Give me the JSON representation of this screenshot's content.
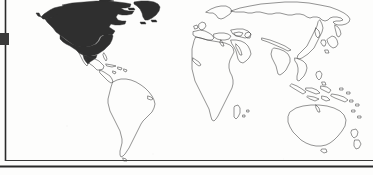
{
  "figure": {
    "kind": "world-map",
    "projection": "mercator-style world outline",
    "background_color": "#fdfdfc",
    "outline_color": "#3a3a3a",
    "highlight_fill_color": "#2f2f2f",
    "frame_color": "#2a2a2a",
    "caption": "",
    "title": "",
    "scan_artifact": true
  },
  "frame": {
    "left_border": {
      "visible": true,
      "x": 5,
      "y_start": 0,
      "y_end": 161,
      "thickness": 2
    },
    "top_border": {
      "visible": false
    },
    "right_border": {
      "visible": false
    },
    "inner_bottom_rule": {
      "visible": true,
      "y": 160,
      "thickness": 1
    },
    "outer_bottom_rule": {
      "visible": true,
      "y": 166,
      "thickness": 2
    },
    "left_tab_marker": {
      "visible": true,
      "x": 0,
      "y": 33,
      "width": 9,
      "height": 12,
      "color": "#3a3a3a"
    }
  },
  "legend": {
    "entries": [
      {
        "label": "",
        "swatch": "#2f2f2f",
        "meaning": "highlighted region"
      },
      {
        "label": "",
        "swatch": "#ffffff",
        "meaning": "other regions"
      }
    ]
  },
  "chart_data": {
    "type": "map",
    "title": "",
    "xlabel": "",
    "ylabel": "",
    "categories": [
      "North America",
      "Greenland",
      "South America",
      "Europe",
      "Africa",
      "Asia",
      "Australia",
      "Oceania"
    ],
    "values": [
      1,
      1,
      0,
      0,
      0,
      0,
      0,
      0
    ],
    "series": [
      {
        "name": "highlighted",
        "values": [
          1,
          1,
          0,
          0,
          0,
          0,
          0,
          0
        ]
      }
    ],
    "regions": [
      {
        "name": "North America",
        "highlighted": true,
        "fill": "#2f2f2f"
      },
      {
        "name": "Greenland",
        "highlighted": true,
        "fill": "#2f2f2f"
      },
      {
        "name": "Alaska",
        "highlighted": true,
        "fill": "#2f2f2f"
      },
      {
        "name": "Central America",
        "highlighted": false,
        "fill": "none"
      },
      {
        "name": "South America",
        "highlighted": false,
        "fill": "none"
      },
      {
        "name": "Europe",
        "highlighted": false,
        "fill": "none"
      },
      {
        "name": "Africa",
        "highlighted": false,
        "fill": "none"
      },
      {
        "name": "Middle East",
        "highlighted": false,
        "fill": "none"
      },
      {
        "name": "Asia",
        "highlighted": false,
        "fill": "none"
      },
      {
        "name": "India",
        "highlighted": false,
        "fill": "none"
      },
      {
        "name": "Southeast Asia",
        "highlighted": false,
        "fill": "none"
      },
      {
        "name": "Indonesia",
        "highlighted": false,
        "fill": "none"
      },
      {
        "name": "Philippines",
        "highlighted": false,
        "fill": "none"
      },
      {
        "name": "Japan",
        "highlighted": false,
        "fill": "none"
      },
      {
        "name": "Australia",
        "highlighted": false,
        "fill": "none"
      },
      {
        "name": "New Zealand",
        "highlighted": false,
        "fill": "none"
      },
      {
        "name": "Madagascar",
        "highlighted": false,
        "fill": "none"
      }
    ],
    "legend_position": "none",
    "grid": false,
    "annotations": []
  }
}
